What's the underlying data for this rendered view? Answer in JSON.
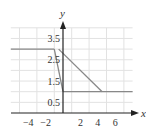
{
  "chart_data": {
    "type": "line",
    "title": "",
    "xlabel": "x",
    "ylabel": "y",
    "xlim": [
      -6,
      8
    ],
    "ylim": [
      0,
      4
    ],
    "grid": true,
    "x_ticks": [
      -4,
      -2,
      2,
      4,
      6
    ],
    "x_tick_labels": [
      "−4",
      "−2",
      "2",
      "4",
      "6"
    ],
    "y_ticks": [
      0.5,
      1.5,
      2.5,
      3.5
    ],
    "y_tick_labels": [
      "0.5",
      "1.5",
      "2.5",
      "3.5"
    ],
    "series": [
      {
        "name": "upper-horizontal",
        "points": [
          [
            -6,
            3
          ],
          [
            -1,
            3
          ]
        ]
      },
      {
        "name": "steep-segment",
        "points": [
          [
            -1,
            3
          ],
          [
            0,
            1
          ]
        ]
      },
      {
        "name": "diagonal-segment",
        "points": [
          [
            -0.5,
            3
          ],
          [
            4.5,
            1
          ]
        ]
      },
      {
        "name": "lower-horizontal",
        "points": [
          [
            0,
            1
          ],
          [
            8,
            1
          ]
        ]
      }
    ],
    "colors": {
      "line": "#888888",
      "axis": "#222222",
      "grid": "#e2e2e2"
    }
  }
}
